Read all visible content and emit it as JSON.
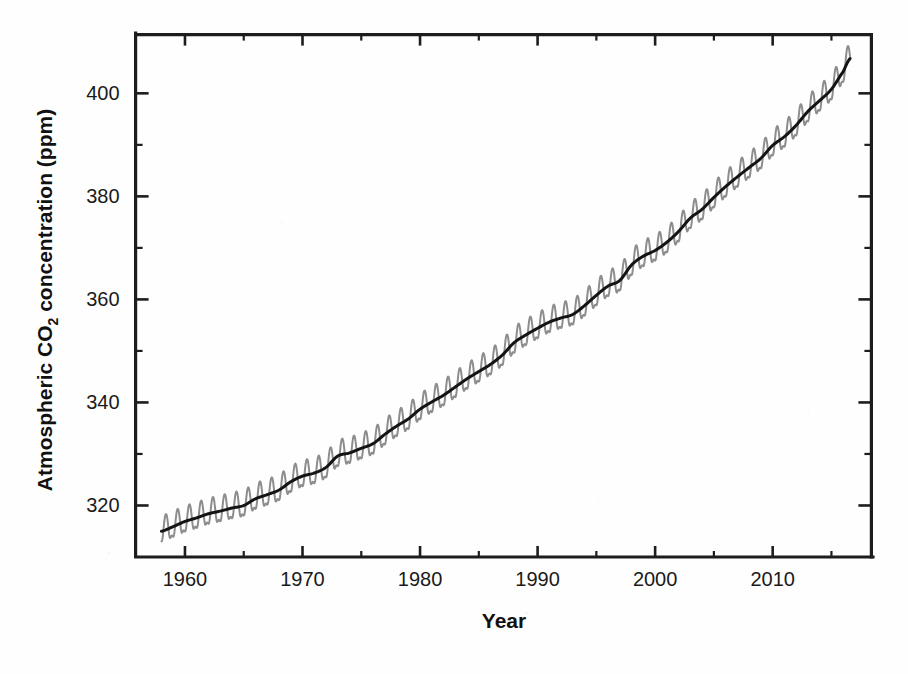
{
  "chart_data": {
    "type": "line",
    "title": "",
    "xlabel": "Year",
    "ylabel": "Atmospheric CO2 concentration (ppm)",
    "ylabel_parts": {
      "pre": "Atmospheric CO",
      "sub": "2",
      "post": " concentration (ppm)"
    },
    "xlim": [
      1955.8,
      2018.4
    ],
    "ylim": [
      310.0,
      411.4
    ],
    "grid": false,
    "legend": "none",
    "xticks": [
      1960,
      1970,
      1980,
      1990,
      2000,
      2010
    ],
    "xtick_labels": [
      "1960",
      "1970",
      "1980",
      "1990",
      "2000",
      "2010"
    ],
    "xticks_minor": [
      1965,
      1975,
      1985,
      1995,
      2005,
      2015
    ],
    "yticks": [
      320,
      340,
      360,
      380,
      400
    ],
    "ytick_labels": [
      "320",
      "340",
      "360",
      "380",
      "400"
    ],
    "yticks_minor": [
      330,
      350,
      370,
      390
    ],
    "colors": {
      "seasonal": "#8d8d8d",
      "trend": "#141414",
      "axis": "#1d1d1d",
      "background": "#fefefe"
    },
    "series": [
      {
        "name": "Monthly mean (seasonal cycle)",
        "color": "#8d8d8d",
        "style": "solid-thin",
        "description": "Monthly mean CO2 with seasonal sawtooth oscillation, amplitude about 3 ppm peak-to-trough-half",
        "seasonal_amplitude_ppm": 3.1,
        "peak_month": 5,
        "trough_month": 9
      },
      {
        "name": "Smoothed trend",
        "color": "#141414",
        "style": "solid-thick",
        "x": [
          1958.0,
          1959,
          1960,
          1961,
          1962,
          1963,
          1964,
          1965,
          1966,
          1967,
          1968,
          1969,
          1970,
          1971,
          1972,
          1973,
          1974,
          1975,
          1976,
          1977,
          1978,
          1979,
          1980,
          1981,
          1982,
          1983,
          1984,
          1985,
          1986,
          1987,
          1988,
          1989,
          1990,
          1991,
          1992,
          1993,
          1994,
          1995,
          1996,
          1997,
          1998,
          1999,
          2000,
          2001,
          2002,
          2003,
          2004,
          2005,
          2006,
          2007,
          2008,
          2009,
          2010,
          2011,
          2012,
          2013,
          2014,
          2015,
          2016,
          2016.6
        ],
        "values": [
          315.0,
          315.9,
          316.9,
          317.6,
          318.4,
          318.9,
          319.5,
          320.0,
          321.3,
          322.1,
          323.0,
          324.6,
          325.7,
          326.3,
          327.4,
          329.6,
          330.2,
          331.1,
          332.0,
          333.8,
          335.4,
          336.8,
          338.7,
          340.1,
          341.4,
          343.0,
          344.6,
          346.0,
          347.4,
          349.2,
          351.6,
          353.1,
          354.4,
          355.6,
          356.4,
          357.1,
          358.8,
          360.8,
          362.6,
          363.7,
          366.7,
          368.4,
          369.5,
          371.1,
          373.2,
          375.8,
          377.5,
          379.8,
          381.9,
          383.8,
          385.6,
          387.4,
          389.9,
          391.6,
          393.8,
          396.5,
          398.6,
          400.8,
          404.2,
          406.8
        ],
        "units": "ppm"
      }
    ],
    "data_start_year": 1958.0,
    "data_end_year": 2016.6,
    "data_start_value": 315.0,
    "data_end_value": 406.8
  }
}
